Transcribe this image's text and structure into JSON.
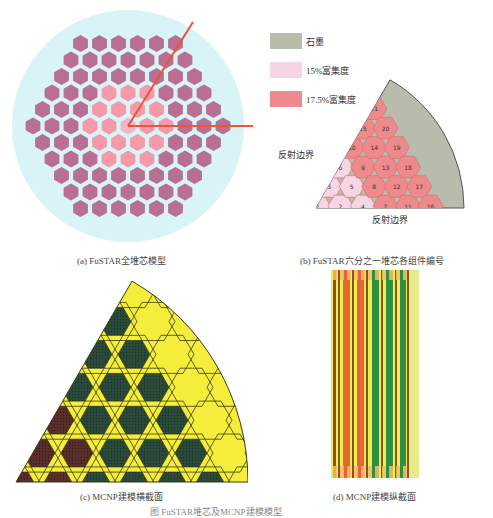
{
  "figure_caption": "图 FuSTAR堆芯及MCNP建模模型",
  "panels": {
    "a": {
      "caption": "(a) FuSTAR全堆芯模型",
      "colors": {
        "background": "#d9f4f6",
        "assembly": "#b86f92",
        "enriched_17_5": "#f59aa8",
        "enriched_15": "#f2b6c4",
        "sector_line": "#e8553c"
      }
    },
    "b": {
      "caption": "(b) FuSTAR六分之一堆芯各组件编号",
      "legend": [
        {
          "label": "石墨",
          "color": "#b9bcad"
        },
        {
          "label": "15%富集度",
          "color": "#f6d6e2"
        },
        {
          "label": "17.5%富集度",
          "color": "#ef8a8c"
        }
      ],
      "boundary_labels": {
        "left": "反射边界",
        "bottom": "反射边界"
      },
      "assemblies": [
        {
          "id": "1",
          "type": "15"
        },
        {
          "id": "2",
          "type": "15"
        },
        {
          "id": "3",
          "type": "15"
        },
        {
          "id": "4",
          "type": "15"
        },
        {
          "id": "5",
          "type": "15"
        },
        {
          "id": "6",
          "type": "15"
        },
        {
          "id": "7",
          "type": "17.5"
        },
        {
          "id": "8",
          "type": "17.5"
        },
        {
          "id": "9",
          "type": "17.5"
        },
        {
          "id": "10",
          "type": "17.5"
        },
        {
          "id": "11",
          "type": "17.5"
        },
        {
          "id": "12",
          "type": "17.5"
        },
        {
          "id": "13",
          "type": "17.5"
        },
        {
          "id": "14",
          "type": "17.5"
        },
        {
          "id": "15",
          "type": "17.5"
        },
        {
          "id": "16",
          "type": "17.5"
        },
        {
          "id": "17",
          "type": "17.5"
        },
        {
          "id": "18",
          "type": "17.5"
        },
        {
          "id": "19",
          "type": "17.5"
        },
        {
          "id": "20",
          "type": "17.5"
        },
        {
          "id": "21",
          "type": "17.5"
        }
      ],
      "colors": {
        "graphite": "#b9bcad",
        "border": "#555555"
      }
    },
    "c": {
      "caption": "(c) MCNP建模横截面",
      "colors": {
        "moderator": "#f4ee3a",
        "fuel_green": "#2a4a3a",
        "fuel_brown": "#5a2e2a",
        "outline": "#3a3a1a"
      }
    },
    "d": {
      "caption": "(d) MCNP建模纵截面",
      "colors": {
        "yellow": "#eef04a",
        "orange": "#e8633a",
        "green": "#2f8f46",
        "brown": "#8a5030",
        "tan": "#f2c064",
        "pale": "#e6ec8a"
      }
    }
  }
}
